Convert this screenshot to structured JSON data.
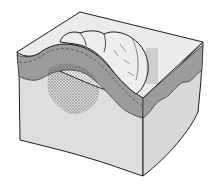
{
  "figure": {
    "labels": [],
    "colors": {
      "background": "#ffffff",
      "surface": "#e6e6e6",
      "epidermis_band": "#9a9a9a",
      "dermis": "#dcdcdc",
      "outline": "#1e1e1e",
      "stipple": "#4a4a4a",
      "nodule": "#ececec"
    }
  }
}
